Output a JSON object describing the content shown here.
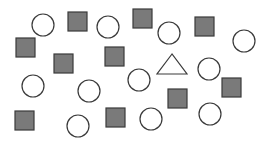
{
  "canvas": {
    "width": 271,
    "height": 142,
    "background": "#ffffff"
  },
  "colors": {
    "stroke": "#3a3a3a",
    "square_fill": "#7a7a7a",
    "circle_fill": "#ffffff",
    "triangle_fill": "#ffffff"
  },
  "shapes": {
    "circles": [
      {
        "cx": 43,
        "cy": 25,
        "r": 11
      },
      {
        "cx": 108,
        "cy": 27,
        "r": 11
      },
      {
        "cx": 169,
        "cy": 33,
        "r": 11
      },
      {
        "cx": 244,
        "cy": 41,
        "r": 11
      },
      {
        "cx": 33,
        "cy": 86,
        "r": 11
      },
      {
        "cx": 89,
        "cy": 91,
        "r": 11
      },
      {
        "cx": 139,
        "cy": 80,
        "r": 11
      },
      {
        "cx": 209,
        "cy": 69,
        "r": 11
      },
      {
        "cx": 78,
        "cy": 126,
        "r": 11
      },
      {
        "cx": 151,
        "cy": 119,
        "r": 11
      },
      {
        "cx": 210,
        "cy": 114,
        "r": 11
      }
    ],
    "squares": [
      {
        "x": 68,
        "y": 12,
        "size": 19
      },
      {
        "x": 133,
        "y": 9,
        "size": 19
      },
      {
        "x": 195,
        "y": 17,
        "size": 19
      },
      {
        "x": 16,
        "y": 38,
        "size": 19
      },
      {
        "x": 54,
        "y": 54,
        "size": 19
      },
      {
        "x": 105,
        "y": 47,
        "size": 19
      },
      {
        "x": 222,
        "y": 78,
        "size": 19
      },
      {
        "x": 168,
        "y": 89,
        "size": 19
      },
      {
        "x": 15,
        "y": 111,
        "size": 19
      },
      {
        "x": 106,
        "y": 108,
        "size": 19
      }
    ],
    "triangles": [
      {
        "points": [
          [
            172,
            54
          ],
          [
            157,
            74
          ],
          [
            187,
            74
          ]
        ]
      }
    ]
  }
}
